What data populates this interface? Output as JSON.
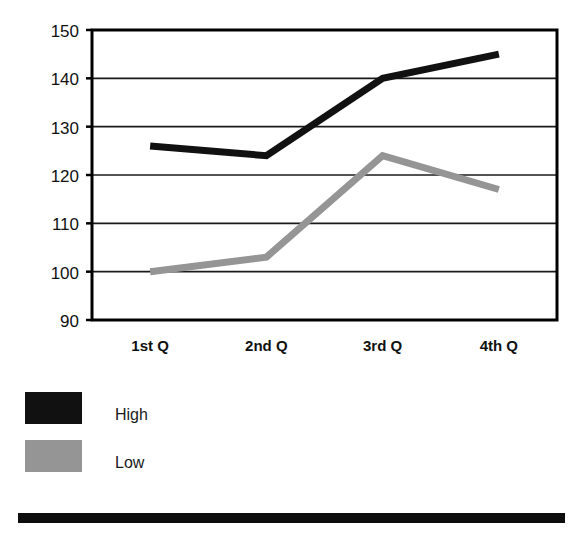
{
  "chart_data": {
    "type": "line",
    "title": "",
    "subtitle": "",
    "xlabel": "",
    "ylabel": "",
    "categories": [
      "1st Q",
      "2nd Q",
      "3rd Q",
      "4th Q"
    ],
    "series": [
      {
        "name": "High",
        "color": "#111111",
        "values": [
          126,
          124,
          140,
          145
        ]
      },
      {
        "name": "Low",
        "color": "#959595",
        "values": [
          100,
          103,
          124,
          117
        ]
      }
    ],
    "ylim": [
      90,
      150
    ],
    "yticks": [
      150,
      140,
      130,
      120,
      110,
      100,
      90
    ],
    "ytick_labels": [
      "150",
      "140",
      "130",
      "120",
      "110",
      "100",
      "90"
    ],
    "grid": "horizontal",
    "legend_position": "below-left"
  },
  "axis": {
    "y_tick_0": "150",
    "y_tick_1": "140",
    "y_tick_2": "130",
    "y_tick_3": "120",
    "y_tick_4": "110",
    "y_tick_5": "100",
    "y_tick_6": "90",
    "x_tick_0": "1st Q",
    "x_tick_1": "2nd Q",
    "x_tick_2": "3rd Q",
    "x_tick_3": "4th Q"
  },
  "legend": {
    "items": [
      {
        "label": "High",
        "color": "#111111"
      },
      {
        "label": "Low",
        "color": "#959595"
      }
    ],
    "item_0_label": "High",
    "item_1_label": "Low"
  },
  "colors": {
    "high_series": "#111111",
    "low_series": "#959595",
    "axis": "#000000",
    "gridline": "#1a1a1a",
    "background": "#ffffff",
    "footer_bar": "#0d0d0d"
  }
}
